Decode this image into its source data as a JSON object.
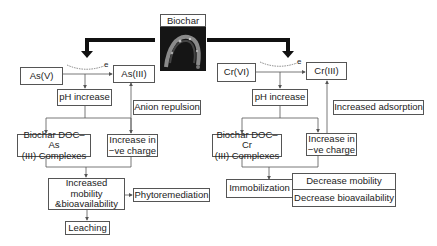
{
  "biochar": {
    "title": "Biochar",
    "image": "biochar-sem-micrograph"
  },
  "arsenic": {
    "source": "As(V)",
    "product": "As(III)",
    "electron": "e",
    "ph": "pH increase",
    "side_effect": "Anion repulsion",
    "complex_line1": "Biochar DOC–As",
    "complex_line2": "(III) Complexes",
    "charge_line1": "Increase in",
    "charge_line2": "−ve charge",
    "mobility_line1": "Increased mobility",
    "mobility_line2": "&bioavailability",
    "phyto": "Phytoremediation",
    "leaching": "Leaching"
  },
  "chromium": {
    "source": "Cr(VI)",
    "product": "Cr(III)",
    "electron": "e",
    "ph": "pH increase",
    "side_effect": "Increased adsorption",
    "complex_line1": "Biochar DOC–Cr",
    "complex_line2": "(III) Complexes",
    "charge_line1": "Increase in",
    "charge_line2": "−ve charge",
    "immobilization": "Immobilization",
    "decrease_mobility": "Decrease mobility",
    "decrease_bioavailability": "Decrease bioavailability"
  },
  "colors": {
    "line": "#555555",
    "thick_arrow": "#111111",
    "image_bg": "#111111"
  }
}
